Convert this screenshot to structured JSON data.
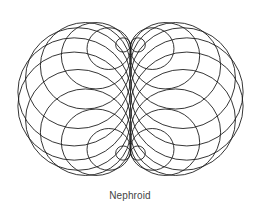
{
  "figure": {
    "title": "Nephroid",
    "caption": "Nephroid",
    "construction": {
      "description": "Envelope of circles centered on a base circle, each tangent to the vertical diameter",
      "center_x": 130.5,
      "center_y": 99,
      "base_radius": 56.8,
      "y_scale": 0.96,
      "circle_count": 24,
      "angle_step_deg": 15,
      "angle_offset_deg": 7.5
    },
    "colors": {
      "stroke": "#1a1a1a",
      "background": "#ffffff",
      "caption": "#444444"
    },
    "stroke_width": 0.9
  }
}
